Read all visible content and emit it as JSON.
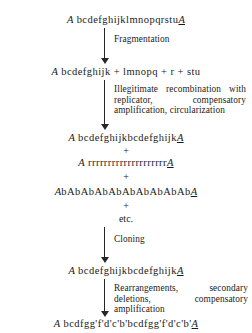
{
  "figure": {
    "type": "flow-diagram"
  },
  "sequences": {
    "s1_prefix": "A",
    "s1_body": " bcdefghijklmnopqrstu",
    "s1_suffix": "A",
    "s2_prefix": "A",
    "s2_body": " bcdefghijk + lmnopq + r + stu",
    "s3_prefix": "A",
    "s3_body": " bcdefghijkbcdefghijk",
    "s3_suffix": "A",
    "s4_prefix": "A",
    "s4_body": " rrrrrrrrrrrrrrrrrrrr",
    "s4_suffix": "A",
    "s5_prefix": "A",
    "s5_body": "bAbAbAbAbAbAbAbAbAb",
    "s5_suffix": "A",
    "s6_prefix": "A",
    "s6_body": " bcdefghijkbcdefghijk",
    "s6_suffix": "A",
    "s7_prefix": "A",
    "s7_body": " bcdfgg'f'd'c'b'bcdfgg'f'd'c'b'",
    "s7_suffix": "A"
  },
  "connectors": {
    "plus1": "+",
    "plus2": "+",
    "plus3": "+",
    "etc": "etc."
  },
  "annotations": {
    "step1": "Fragmentation",
    "step2": "Illegitimate recombination with replicator, compensatory amplification, circularization",
    "step3": "Cloning",
    "step4": "Rearrangements, secondary deletions, compensatory amplification"
  }
}
